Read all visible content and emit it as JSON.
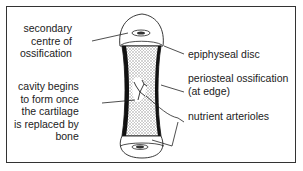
{
  "diagram": {
    "labels_left": {
      "secondary_centre": "secondary\ncentre of\nossification",
      "cavity": "cavity begins\nto form once\nthe cartilage\nis replaced by\nbone"
    },
    "labels_right": {
      "epiphyseal_disc": "epiphyseal disc",
      "periosteal": "periosteal ossification\n(at edge)",
      "nutrient": "nutrient arterioles"
    },
    "colors": {
      "stroke": "#222222",
      "shaft_fill": "#d8d8d8",
      "frame": "#333333"
    }
  }
}
